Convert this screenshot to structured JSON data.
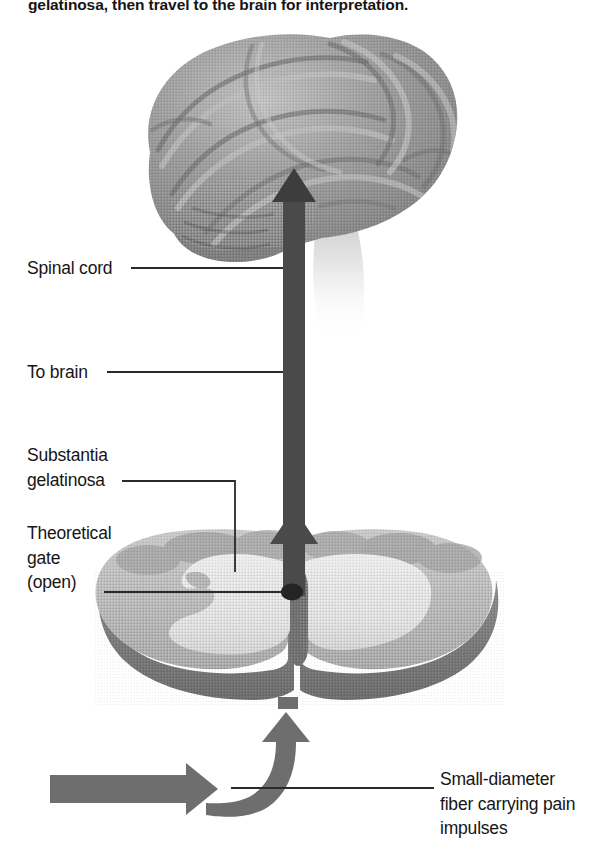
{
  "figure": {
    "caption_top": "gelatinosa, then travel to the brain for interpretation.",
    "background": "#ffffff"
  },
  "labels": {
    "spinal_cord": "Spinal cord",
    "to_brain": "To brain",
    "substantia_gelatinosa": "Substantia\ngelatinosa",
    "theoretical_gate": "Theoretical\ngate\n(open)",
    "small_fiber": "Small-diameter\nfiber carrying pain\nimpulses"
  },
  "colors": {
    "text": "#151515",
    "leader_line": "#2a2a2a",
    "ascending_arrow": "#4a4a4a",
    "afferent_arrow": "#6e6e6e",
    "brain_mid": "#8e8e8e",
    "brain_light": "#b5b5b5",
    "brain_dark": "#6f6f6f",
    "brainstem_fade": "#d9d9d9",
    "cord_gray_matter": "#e4e4e4",
    "cord_white_matter": "#bdbdbd",
    "cord_rim_dark": "#757575",
    "gate_dot": "#222222",
    "background": "#ffffff"
  },
  "elements": {
    "brain_illustration": "brain-lateral-view",
    "brainstem": "brainstem-faded",
    "cord_cross_section": "spinal-cord-cross-section",
    "ascending_arrow": "arrow-up-to-brain",
    "gate_arrow": "arrow-up-through-gate",
    "afferent_arrow": "arrow-right-into-cord",
    "curved_arrow": "arrow-curved-up-into-dorsal-horn",
    "gate_dot": "theoretical-gate-marker"
  }
}
